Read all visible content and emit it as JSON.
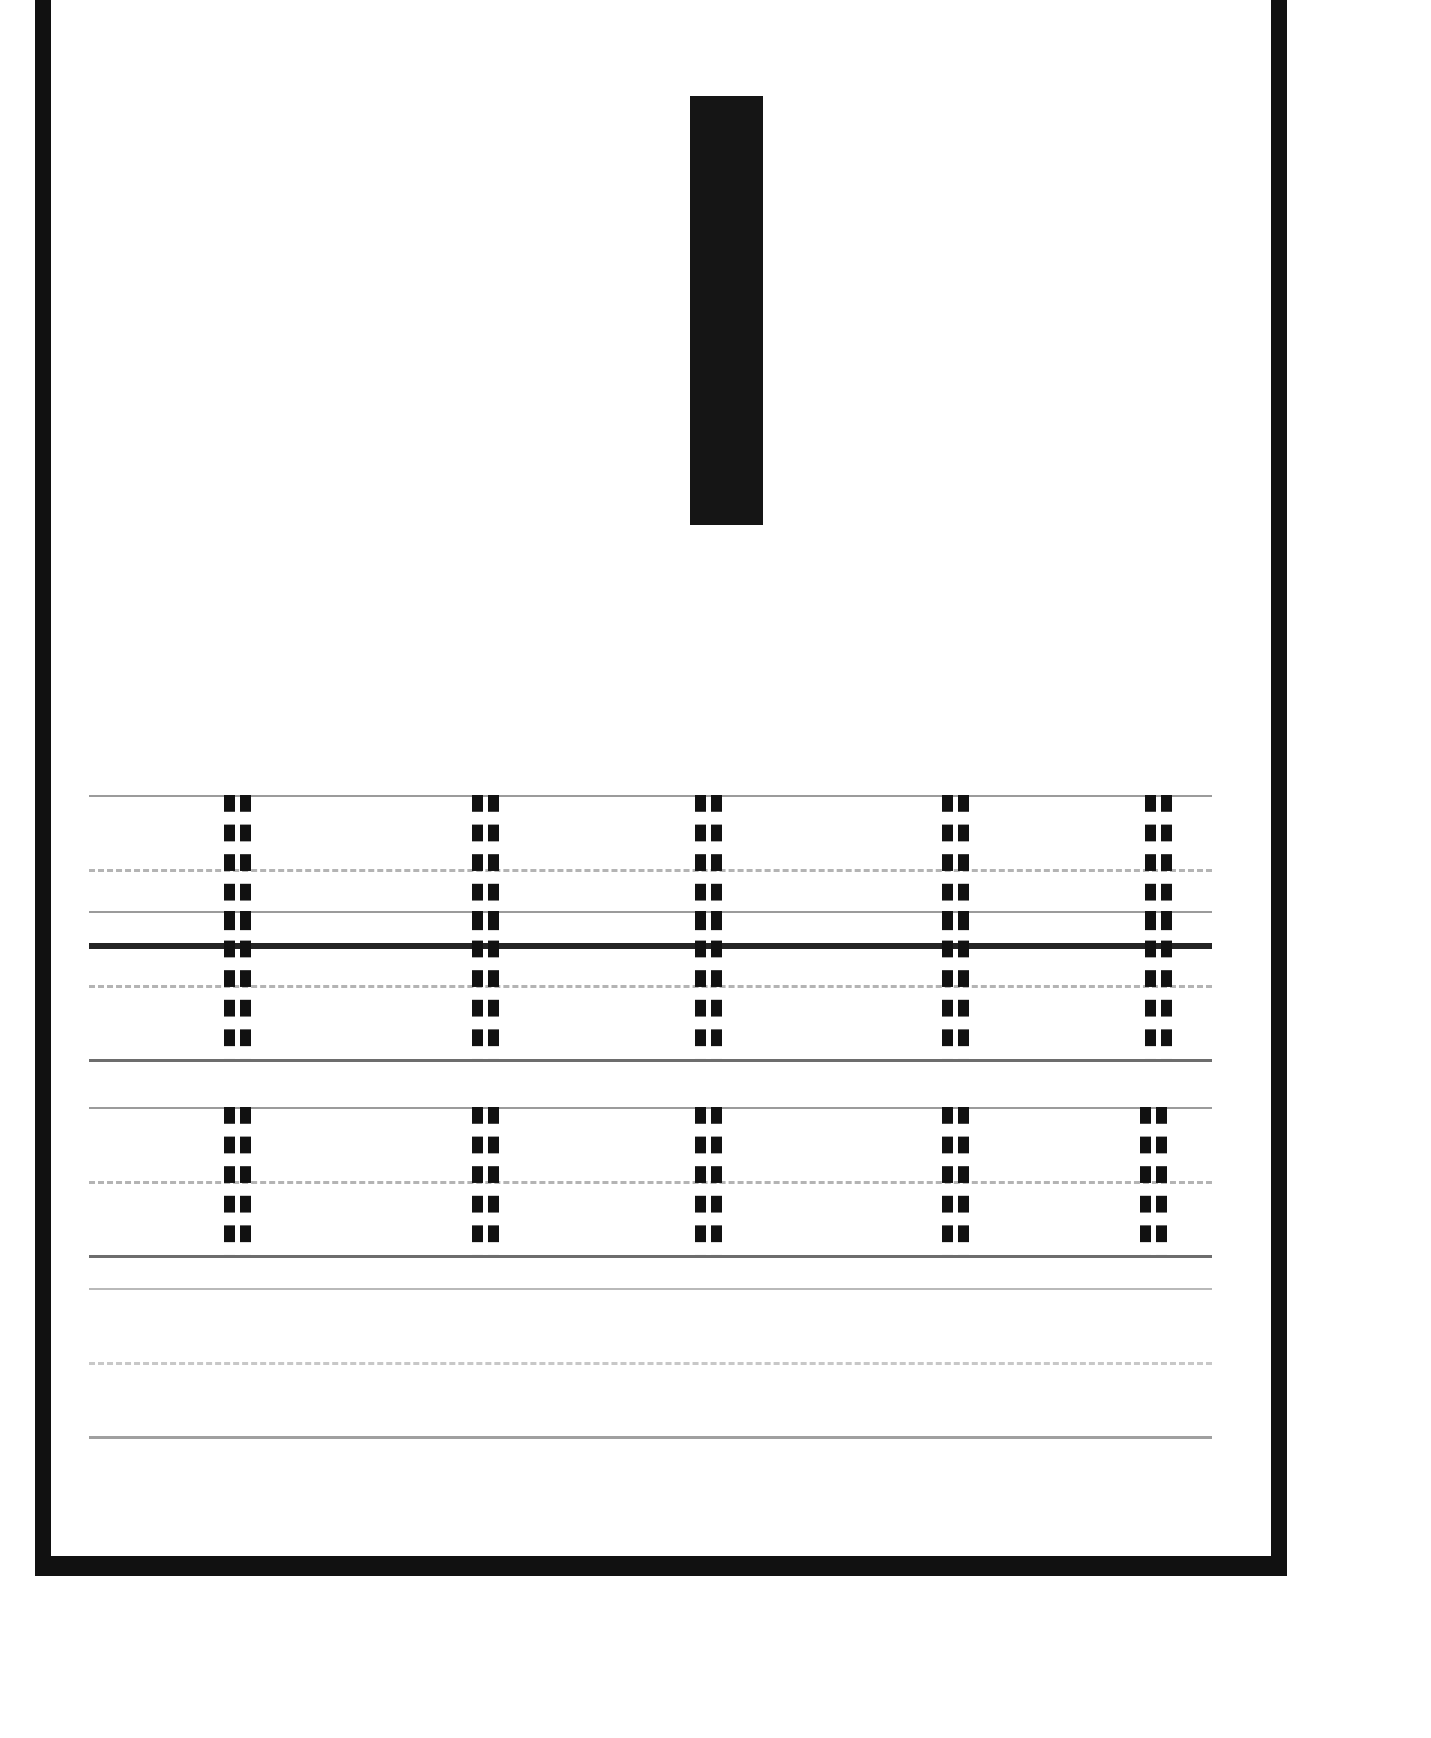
{
  "worksheet": {
    "type": "letter-tracing-practice-sheet",
    "model_letter": "I",
    "letter_case": "uppercase",
    "model_letter_color": "#151515",
    "page_background": "#ffffff",
    "frame_color": "#111111",
    "trace_glyph_color": "#111111",
    "rule_line_color": "#9b9b9b",
    "midline_color": "#b4b4b4",
    "baseline_color": "#6d6d6d",
    "baseline_heavy_color": "#242424"
  },
  "practice_rows": [
    {
      "id": "row-1",
      "baseline_style": "heavy",
      "glyph_count": 5,
      "glyphs": [
        "I",
        "I",
        "I",
        "I",
        "I"
      ]
    },
    {
      "id": "row-2",
      "baseline_style": "normal",
      "glyph_count": 5,
      "glyphs": [
        "I",
        "I",
        "I",
        "I",
        "I"
      ]
    },
    {
      "id": "row-3",
      "baseline_style": "normal",
      "glyph_count": 5,
      "glyphs": [
        "I",
        "I",
        "I",
        "I",
        "I"
      ]
    },
    {
      "id": "row-4",
      "baseline_style": "normal",
      "glyph_count": 0,
      "glyphs": []
    }
  ],
  "geometry": {
    "row_tops": [
      795,
      911,
      1107,
      1288
    ],
    "row_height": 148,
    "glyph_x_positions": [
      132,
      380,
      603,
      850,
      1053
    ],
    "glyph_x_positions_row3": [
      132,
      380,
      603,
      850,
      1048
    ]
  }
}
